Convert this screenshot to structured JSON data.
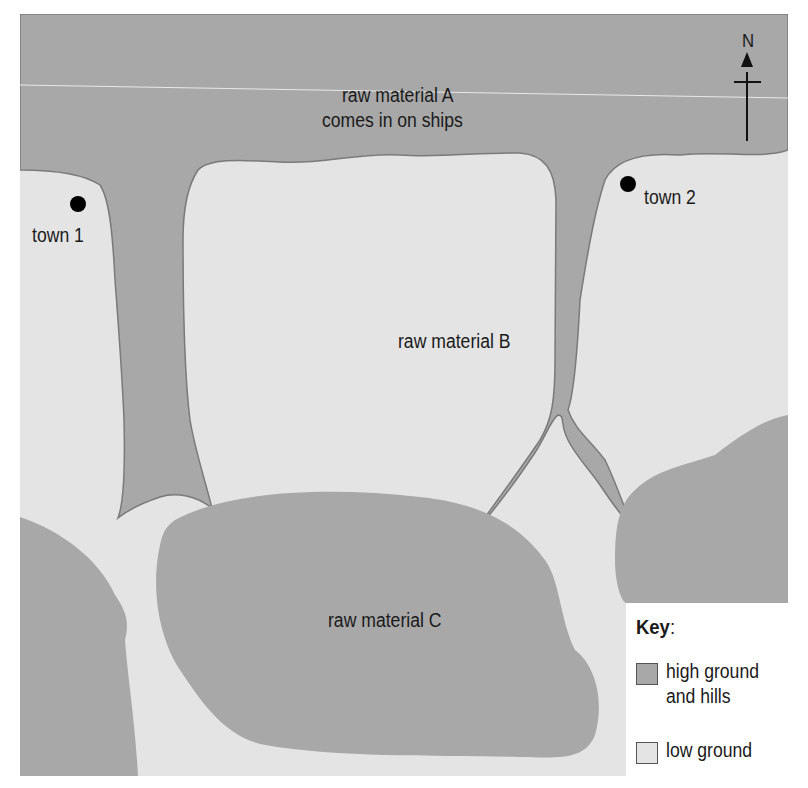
{
  "map": {
    "labels": {
      "sea_line1": "raw material A",
      "sea_line2": "comes in on ships",
      "raw_b": "raw material B",
      "raw_c": "raw material C",
      "town1": "town 1",
      "town2": "town 2",
      "north": "N"
    },
    "colors": {
      "high_ground": "#a8a8a8",
      "low_ground": "#e4e4e4",
      "outline": "#7a7a7a",
      "town_dot": "#000000"
    }
  },
  "key": {
    "title": "Key",
    "title_suffix": ":",
    "items": [
      {
        "label_line1": "high ground",
        "label_line2": "and hills",
        "color": "#a8a8a8"
      },
      {
        "label_line1": "low ground",
        "color": "#e4e4e4"
      }
    ]
  }
}
